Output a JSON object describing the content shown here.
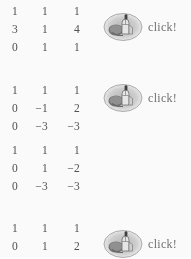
{
  "document": {
    "type": "scanned-math-worksheet",
    "description": "Gaussian elimination steps on a 3x3 matrix",
    "text_color": "#4a4a4a",
    "background_color": "#ffffff",
    "label_color": "#6f6f6f"
  },
  "matrices": [
    {
      "id": "matrix-1",
      "rows": [
        [
          "1",
          "1",
          "1"
        ],
        [
          "3",
          "1",
          "4"
        ],
        [
          "0",
          "1",
          "1"
        ]
      ]
    },
    {
      "id": "matrix-2",
      "rows": [
        [
          "1",
          "1",
          "1"
        ],
        [
          "0",
          "−1",
          "2"
        ],
        [
          "0",
          "−3",
          "−3"
        ]
      ]
    },
    {
      "id": "matrix-3",
      "rows": [
        [
          "1",
          "1",
          "1"
        ],
        [
          "0",
          "1",
          "−2"
        ],
        [
          "0",
          "−3",
          "−3"
        ]
      ]
    },
    {
      "id": "matrix-4",
      "rows": [
        [
          "1",
          "1",
          "1"
        ],
        [
          "0",
          "1",
          "2"
        ]
      ]
    }
  ],
  "click_annotations": [
    {
      "id": "click-1",
      "icon": "mouse-click-icon",
      "label": "click!"
    },
    {
      "id": "click-2",
      "icon": "mouse-click-icon",
      "label": "click!"
    },
    {
      "id": "click-3",
      "icon": "mouse-click-icon",
      "label": "click!"
    }
  ]
}
